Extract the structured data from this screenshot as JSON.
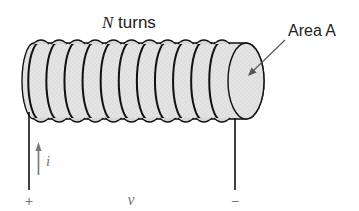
{
  "diagram": {
    "title_label": {
      "symbol": "N",
      "text": " turns"
    },
    "area_label": "Area A",
    "current_label": "i",
    "voltage_label": "v",
    "plus_sign": "+",
    "minus_sign": "−",
    "coil_turns_drawn": 11,
    "colors": {
      "core_fill": "#e2e2e2",
      "wire": "#111111",
      "label": "#222222",
      "annotation": "#777777"
    }
  }
}
